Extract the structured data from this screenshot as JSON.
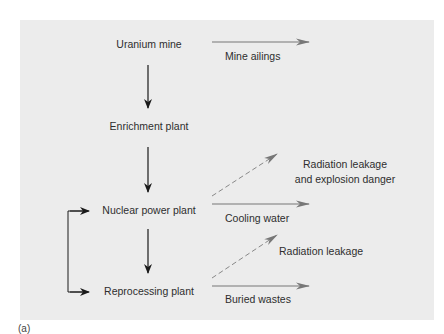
{
  "diagram": {
    "nodes": [
      {
        "id": "uranium-mine",
        "label": "Uranium mine"
      },
      {
        "id": "enrichment-plant",
        "label": "Enrichment plant"
      },
      {
        "id": "nuclear-power-plant",
        "label": "Nuclear power plant"
      },
      {
        "id": "reprocessing-plant",
        "label": "Reprocessing plant"
      }
    ],
    "outputs": {
      "mine_tailings": "Mine ailings",
      "radiation_explosion_line1": "Radiation leakage",
      "radiation_explosion_line2": "and explosion danger",
      "cooling_water": "Cooling water",
      "radiation_leakage": "Radiation leakage",
      "buried_wastes": "Buried wastes"
    },
    "edges": [
      {
        "from": "uranium-mine",
        "to": "enrichment-plant",
        "style": "solid"
      },
      {
        "from": "enrichment-plant",
        "to": "nuclear-power-plant",
        "style": "solid"
      },
      {
        "from": "nuclear-power-plant",
        "to": "reprocessing-plant",
        "style": "solid"
      },
      {
        "from": "reprocessing-plant",
        "to": "nuclear-power-plant",
        "style": "solid-loop"
      },
      {
        "from": "uranium-mine",
        "to": "Mine tailings",
        "style": "solid-gray"
      },
      {
        "from": "nuclear-power-plant",
        "to": "Radiation leakage and explosion danger",
        "style": "dashed-gray"
      },
      {
        "from": "nuclear-power-plant",
        "to": "Cooling water",
        "style": "solid-gray"
      },
      {
        "from": "reprocessing-plant",
        "to": "Radiation leakage",
        "style": "dashed-gray"
      },
      {
        "from": "reprocessing-plant",
        "to": "Buried wastes",
        "style": "solid-gray"
      }
    ],
    "caption": "(a)",
    "colors": {
      "panel": "#ececec",
      "main_arrow": "#1a1a1a",
      "output_arrow": "#777777"
    }
  }
}
